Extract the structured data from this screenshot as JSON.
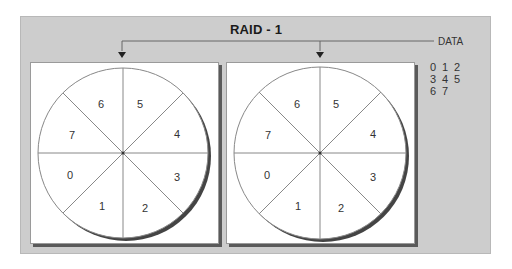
{
  "diagram": {
    "title": "RAID - 1",
    "source_label": "DATA",
    "data_blocks": [
      [
        "0",
        "1",
        "2"
      ],
      [
        "3",
        "4",
        "5"
      ],
      [
        "6",
        "7"
      ]
    ],
    "disks": [
      {
        "name": "disk-1",
        "sectors": [
          {
            "label": "0",
            "x": 70,
            "y": 179
          },
          {
            "label": "1",
            "x": 102,
            "y": 210
          },
          {
            "label": "2",
            "x": 145,
            "y": 212
          },
          {
            "label": "3",
            "x": 177,
            "y": 181
          },
          {
            "label": "4",
            "x": 177,
            "y": 138
          },
          {
            "label": "5",
            "x": 140,
            "y": 108
          },
          {
            "label": "6",
            "x": 101,
            "y": 108
          },
          {
            "label": "7",
            "x": 72,
            "y": 139
          }
        ]
      },
      {
        "name": "disk-2",
        "sectors": [
          {
            "label": "0",
            "x": 267,
            "y": 179
          },
          {
            "label": "1",
            "x": 298,
            "y": 210
          },
          {
            "label": "2",
            "x": 341,
            "y": 212
          },
          {
            "label": "3",
            "x": 373,
            "y": 181
          },
          {
            "label": "4",
            "x": 373,
            "y": 138
          },
          {
            "label": "5",
            "x": 336,
            "y": 108
          },
          {
            "label": "6",
            "x": 297,
            "y": 108
          },
          {
            "label": "7",
            "x": 268,
            "y": 139
          }
        ]
      }
    ],
    "colors": {
      "frame_bg": "#cdcdcd",
      "panel_bg": "#ffffff",
      "line": "#555555",
      "shadow": "#5a5a5a"
    }
  }
}
